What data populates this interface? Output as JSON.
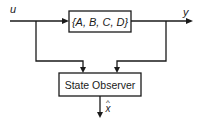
{
  "diagram": {
    "type": "block-diagram",
    "title": "",
    "signals": {
      "input": "u",
      "output": "y",
      "estimate": "x",
      "estimate_accent": "^"
    },
    "blocks": [
      {
        "id": "plant",
        "label": "{A, B, C, D}"
      },
      {
        "id": "observer",
        "label": "State Observer"
      }
    ],
    "connections": [
      {
        "from": "u",
        "to": "plant"
      },
      {
        "from": "plant",
        "to": "y"
      },
      {
        "from": "u",
        "to": "observer"
      },
      {
        "from": "y",
        "to": "observer"
      },
      {
        "from": "observer",
        "to": "x_hat"
      }
    ],
    "colors": {
      "stroke": "#1a1a1a",
      "background": "#ffffff"
    }
  }
}
